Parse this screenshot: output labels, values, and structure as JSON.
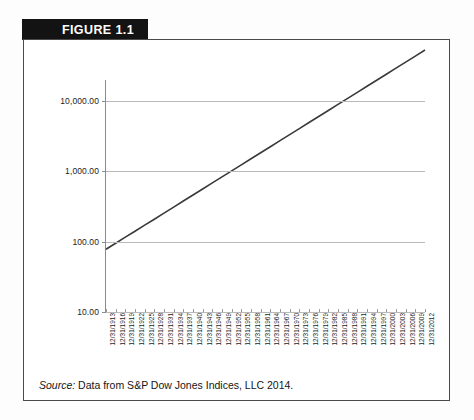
{
  "figure": {
    "banner_label": "FIGURE 1.1",
    "source_label": "Source:",
    "source_text": "Data from S&P Dow Jones Indices, LLC 2014."
  },
  "colors": {
    "banner_bg": "#131313",
    "banner_text": "#ffffff",
    "frame_border": "#4a4a4a",
    "gridline": "#b9b9b9",
    "axis": "#8c8c8c",
    "series_line": "#3a3a3a",
    "page_bg": "#fdfdfd"
  },
  "chart_data": {
    "type": "line",
    "title": "FIGURE 1.1",
    "xlabel": "",
    "ylabel": "",
    "yscale": "log",
    "ylim": [
      10,
      20000
    ],
    "grid": true,
    "legend": false,
    "ytick_labels": [
      "10,000.00",
      "1,000.00",
      "100.00",
      "10.00"
    ],
    "ytick_values": [
      10000,
      1000,
      100,
      10
    ],
    "categories": [
      "12/31/1913",
      "12/31/1916",
      "12/31/1919",
      "12/31/1922",
      "12/31/1925",
      "12/31/1928",
      "12/31/1931",
      "12/31/1934",
      "12/31/1937",
      "12/31/1940",
      "12/31/1943",
      "12/31/1946",
      "12/31/1949",
      "12/31/1952",
      "12/31/1955",
      "12/31/1958",
      "12/31/1961",
      "12/31/1964",
      "12/31/1967",
      "12/31/1970",
      "12/31/1973",
      "12/31/1976",
      "12/31/1979",
      "12/31/1982",
      "12/31/1985",
      "12/31/1988",
      "12/31/1991",
      "12/31/1994",
      "12/31/1997",
      "12/31/2000",
      "12/31/2003",
      "12/31/2006",
      "12/31/2009",
      "12/31/2012"
    ],
    "series": [
      {
        "name": "Dow Jones Industrial Average",
        "values": [
          78,
          95,
          116,
          141,
          172,
          209,
          255,
          311,
          379,
          462,
          563,
          686,
          836,
          1019,
          1242,
          1514,
          1845,
          2249,
          2741,
          3341,
          4072,
          4963,
          6050,
          7374,
          8988,
          10955,
          13354,
          16277,
          19839,
          24183,
          29476,
          35927,
          43790,
          53372
        ]
      }
    ]
  }
}
